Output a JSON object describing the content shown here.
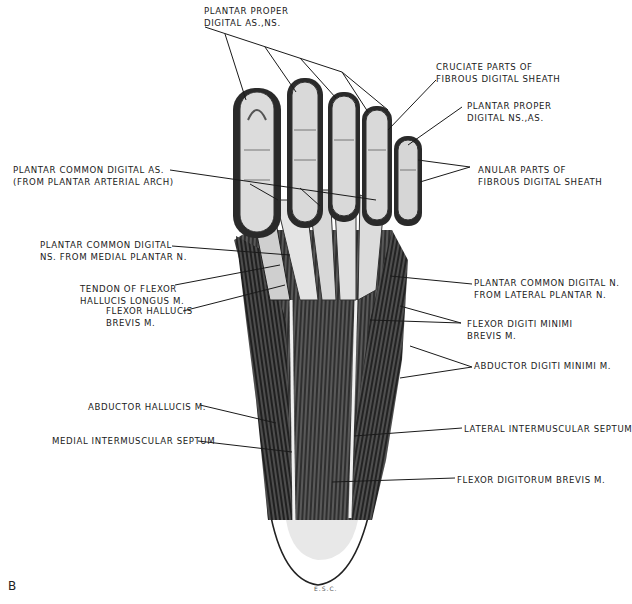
{
  "figure": {
    "panel_letter": "B",
    "artist_signature": "E.S.C.",
    "colors": {
      "background": "#ffffff",
      "ink": "#1a1a1a",
      "muscle_dark": "#2b2b2b",
      "muscle_mid": "#5a5a5a",
      "tendon_light": "#e6e6e6"
    }
  },
  "labels": {
    "plantar_proper_digital_as_ns": {
      "line1": "PLANTAR PROPER",
      "line2": "DIGITAL AS.,NS."
    },
    "cruciate_parts": {
      "line1": "CRUCIATE PARTS OF",
      "line2": "FIBROUS DIGITAL SHEATH"
    },
    "plantar_proper_digital_ns_as": {
      "line1": "PLANTAR PROPER",
      "line2": "DIGITAL NS.,AS."
    },
    "plantar_common_digital_as": {
      "line1": "PLANTAR COMMON DIGITAL AS.",
      "line2": "(FROM PLANTAR ARTERIAL ARCH)"
    },
    "anular_parts": {
      "line1": "ANULAR PARTS OF",
      "line2": "FIBROUS DIGITAL SHEATH"
    },
    "plantar_common_digital_ns_medial": {
      "line1": "PLANTAR COMMON DIGITAL",
      "line2": "NS. FROM MEDIAL PLANTAR N."
    },
    "tendon_flexor_hallucis_longus": {
      "line1": "TENDON OF FLEXOR",
      "line2": "HALLUCIS LONGUS M."
    },
    "flexor_hallucis_brevis": {
      "line1": "FLEXOR HALLUCIS",
      "line2": "BREVIS M."
    },
    "plantar_common_digital_n_lateral": {
      "line1": "PLANTAR COMMON DIGITAL N.",
      "line2": "FROM LATERAL PLANTAR N."
    },
    "flexor_digiti_minimi_brevis": {
      "line1": "FLEXOR DIGITI MINIMI",
      "line2": "BREVIS M."
    },
    "abductor_digiti_minimi": {
      "line1": "ABDUCTOR DIGITI MINIMI M."
    },
    "abductor_hallucis": {
      "line1": "ABDUCTOR HALLUCIS M."
    },
    "medial_intermuscular_septum": {
      "line1": "MEDIAL INTERMUSCULAR SEPTUM"
    },
    "lateral_intermuscular_septum": {
      "line1": "LATERAL INTERMUSCULAR SEPTUM"
    },
    "flexor_digitorum_brevis": {
      "line1": "FLEXOR DIGITORUM BREVIS M."
    }
  }
}
